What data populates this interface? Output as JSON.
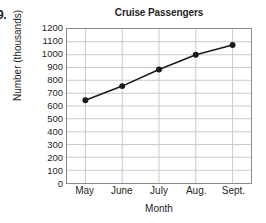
{
  "item_number": "9.",
  "chart_data": {
    "type": "line",
    "title": "Cruise Passengers",
    "xlabel": "Month",
    "ylabel": "Number (thousands)",
    "categories": [
      "May",
      "June",
      "July",
      "Aug.",
      "Sept."
    ],
    "values": [
      645,
      755,
      885,
      1000,
      1075
    ],
    "ylim": [
      0,
      1200
    ],
    "yticks": [
      0,
      100,
      200,
      300,
      400,
      500,
      600,
      700,
      800,
      900,
      1000,
      1100,
      1200
    ],
    "ytick_labels": [
      "0",
      "100",
      "200",
      "300",
      "400",
      "500",
      "600",
      "700",
      "800",
      "900",
      "1000",
      "1100",
      "1200"
    ],
    "grid": true,
    "grid_color": "#c9c9c9",
    "legend": null,
    "series_color": "#1a1a1a",
    "marker": "circle",
    "marker_color": "#1a1a1a",
    "frame_color": "#8a8a8a"
  }
}
